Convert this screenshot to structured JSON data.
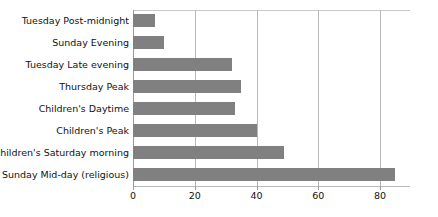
{
  "chart_data": {
    "type": "bar",
    "orientation": "horizontal",
    "title": "",
    "subtitle": "",
    "xlabel": "",
    "ylabel": "",
    "categories": [
      "Tuesday Post-midnight",
      "Sunday Evening",
      "Tuesday Late evening",
      "Thursday Peak",
      "Children's Daytime",
      "Children's Peak",
      "Children's Saturday morning",
      "Sunday Mid-day (religious)"
    ],
    "values": [
      7,
      10,
      32,
      35,
      33,
      40,
      49,
      85
    ],
    "xlim": [
      0,
      90
    ],
    "xticks": [
      0,
      20,
      40,
      60,
      80
    ],
    "xtick_labels": [
      "0",
      "20",
      "40",
      "60",
      "80"
    ],
    "grid": true,
    "grid_axis": "x",
    "legend": false,
    "legend_position": "none",
    "bar_color": "#808080",
    "gridline_color": "#b9b9b9",
    "background_color": "#ffffff",
    "text_color": "#111111"
  }
}
